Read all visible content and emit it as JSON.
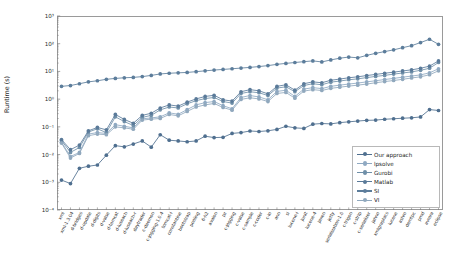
{
  "chart_data": {
    "type": "line",
    "title": "",
    "xlabel": "",
    "ylabel": "Runtime (s)",
    "yscale": "log",
    "ylim": [
      0.0001,
      1000
    ],
    "ytick_labels": [
      "10³",
      "10²",
      "10¹",
      "10⁰",
      "10⁻¹",
      "10⁻²",
      "10⁻³",
      "10⁻⁴"
    ],
    "ytick_values": [
      1000,
      100,
      10,
      1,
      0.1,
      0.01,
      0.001,
      0.0001
    ],
    "grid": false,
    "legend_position": "lower right",
    "categories": [
      "xml",
      "xml-1.3.04",
      "d-bridges",
      "d-update",
      "d-digits",
      "d-valse",
      "d-tomcat",
      "d-luseach",
      "d-luseach-r",
      "daytrader",
      "c-daemon",
      "c-jogging-1.0.4",
      "tomcat-i",
      "constantine",
      "bootstrap",
      "pooling",
      "6-h2",
      "avalon",
      "pz",
      "c-jogging",
      "c-valse",
      "c-sample",
      "c-coder",
      "c-io",
      "ann",
      "sl",
      "lucene-i",
      "junit",
      "lucene-4",
      "jaxen",
      "jetty",
      "serialization-1.0",
      "c-trigon",
      "c-strip",
      "c-serializer",
      "jahno",
      "xmlgraphics",
      "lucene",
      "ashro",
      "demtpc",
      "pmd",
      "avrora",
      "eclipse"
    ],
    "series": [
      {
        "name": "Our approach",
        "color": "#4f6f8f",
        "values": [
          0.0012,
          0.0009,
          0.0032,
          0.0038,
          0.0042,
          0.0095,
          0.021,
          0.019,
          0.024,
          0.031,
          0.0185,
          0.052,
          0.033,
          0.031,
          0.029,
          0.031,
          0.046,
          0.041,
          0.042,
          0.058,
          0.062,
          0.071,
          0.068,
          0.072,
          0.081,
          0.105,
          0.092,
          0.088,
          0.125,
          0.132,
          0.128,
          0.142,
          0.152,
          0.162,
          0.172,
          0.175,
          0.188,
          0.196,
          0.205,
          0.212,
          0.228,
          0.42,
          0.39
        ]
      },
      {
        "name": "lpsolve",
        "color": "#8fa9c2",
        "values": [
          0.028,
          0.0085,
          0.012,
          0.055,
          0.062,
          0.058,
          0.12,
          0.105,
          0.092,
          0.195,
          0.21,
          0.23,
          0.32,
          0.285,
          0.42,
          0.62,
          0.75,
          0.82,
          0.58,
          0.45,
          1.15,
          1.35,
          1.2,
          0.95,
          1.9,
          2.1,
          1.25,
          2.3,
          2.6,
          2.4,
          2.9,
          3.2,
          3.5,
          3.8,
          4.2,
          4.6,
          5.1,
          5.6,
          6.2,
          6.8,
          7.5,
          8.9,
          12.5
        ]
      },
      {
        "name": "Gurobi",
        "color": "#6f8fa8",
        "values": [
          0.032,
          0.012,
          0.018,
          0.065,
          0.085,
          0.062,
          0.23,
          0.155,
          0.112,
          0.22,
          0.26,
          0.41,
          0.52,
          0.48,
          0.68,
          0.88,
          1.05,
          1.15,
          0.82,
          0.72,
          1.6,
          1.85,
          1.7,
          1.35,
          2.5,
          2.8,
          1.85,
          3.1,
          3.6,
          3.3,
          4.1,
          4.5,
          5.0,
          5.4,
          6.0,
          6.6,
          7.2,
          8.0,
          8.8,
          9.6,
          11.0,
          13.0,
          21.0
        ]
      },
      {
        "name": "Matlab",
        "color": "#5a7a99",
        "values": [
          0.035,
          0.015,
          0.022,
          0.072,
          0.095,
          0.078,
          0.28,
          0.185,
          0.135,
          0.26,
          0.31,
          0.48,
          0.62,
          0.56,
          0.78,
          1.02,
          1.25,
          1.38,
          0.95,
          0.85,
          1.85,
          2.2,
          2.0,
          1.55,
          2.9,
          3.3,
          2.1,
          3.6,
          4.2,
          3.9,
          4.8,
          5.3,
          5.9,
          6.4,
          7.1,
          7.8,
          8.6,
          9.4,
          10.4,
          11.4,
          13.0,
          15.5,
          24.0
        ]
      },
      {
        "name": "SI",
        "color": "#5c7d9b",
        "values": [
          2.9,
          3.1,
          3.6,
          4.2,
          4.6,
          5.2,
          5.6,
          5.9,
          6.1,
          6.5,
          7.2,
          8.1,
          8.6,
          8.9,
          9.2,
          9.8,
          10.5,
          11.2,
          11.8,
          12.5,
          13.2,
          14.0,
          15.0,
          16.2,
          18.0,
          19.5,
          21.0,
          22.5,
          24.0,
          22.0,
          26.0,
          30.0,
          33.0,
          31.0,
          38.0,
          45.0,
          52.0,
          60.0,
          72.0,
          85.0,
          110.0,
          145.0,
          95.0
        ]
      },
      {
        "name": "VI",
        "color": "#90a8bd",
        "values": [
          0.026,
          0.0075,
          0.011,
          0.048,
          0.055,
          0.052,
          0.1,
          0.092,
          0.082,
          0.175,
          0.19,
          0.2,
          0.28,
          0.25,
          0.36,
          0.52,
          0.62,
          0.7,
          0.5,
          0.4,
          0.98,
          1.12,
          1.02,
          0.82,
          1.6,
          1.75,
          1.08,
          1.95,
          2.2,
          2.05,
          2.45,
          2.7,
          2.95,
          3.2,
          3.5,
          3.9,
          4.3,
          4.7,
          5.2,
          5.8,
          6.4,
          7.6,
          10.5
        ]
      }
    ]
  },
  "legend": {
    "items": [
      {
        "label": "Our approach"
      },
      {
        "label": "lpsolve"
      },
      {
        "label": "Gurobi"
      },
      {
        "label": "Matlab"
      },
      {
        "label": "SI"
      },
      {
        "label": "VI"
      }
    ]
  }
}
